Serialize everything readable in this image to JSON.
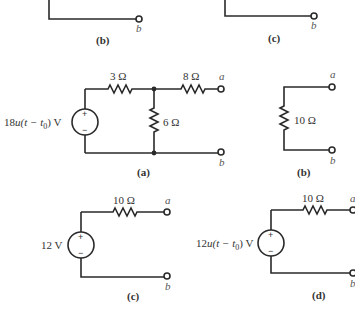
{
  "top_partial": {
    "left": {
      "terminal": "b",
      "caption": "(b)"
    },
    "right": {
      "terminal": "b",
      "caption": "(c)"
    }
  },
  "circuit_a": {
    "source": {
      "label_prefix": "18",
      "label_func": "u",
      "label_arg": "(t − t",
      "label_sub": "0",
      "label_end": ") V",
      "plus": "+",
      "minus": "−"
    },
    "r_series": "3 Ω",
    "r_shunt": "6 Ω",
    "r_out": "8 Ω",
    "terminal_top": "a",
    "terminal_bottom": "b",
    "caption": "(a)"
  },
  "circuit_b": {
    "resistor": "10 Ω",
    "terminal_top": "a",
    "terminal_bottom": "b",
    "caption": "(b)"
  },
  "circuit_c": {
    "source": {
      "label": "12 V",
      "plus": "+",
      "minus": "−"
    },
    "resistor": "10 Ω",
    "terminal_top": "a",
    "terminal_bottom": "b",
    "caption": "(c)"
  },
  "circuit_d": {
    "source": {
      "label_prefix": "12",
      "label_func": "u",
      "label_arg": "(t − t",
      "label_sub": "0",
      "label_end": ") V",
      "plus": "+",
      "minus": "−"
    },
    "resistor": "10 Ω",
    "terminal_top": "a",
    "terminal_bottom": "b",
    "caption": "(d)"
  }
}
